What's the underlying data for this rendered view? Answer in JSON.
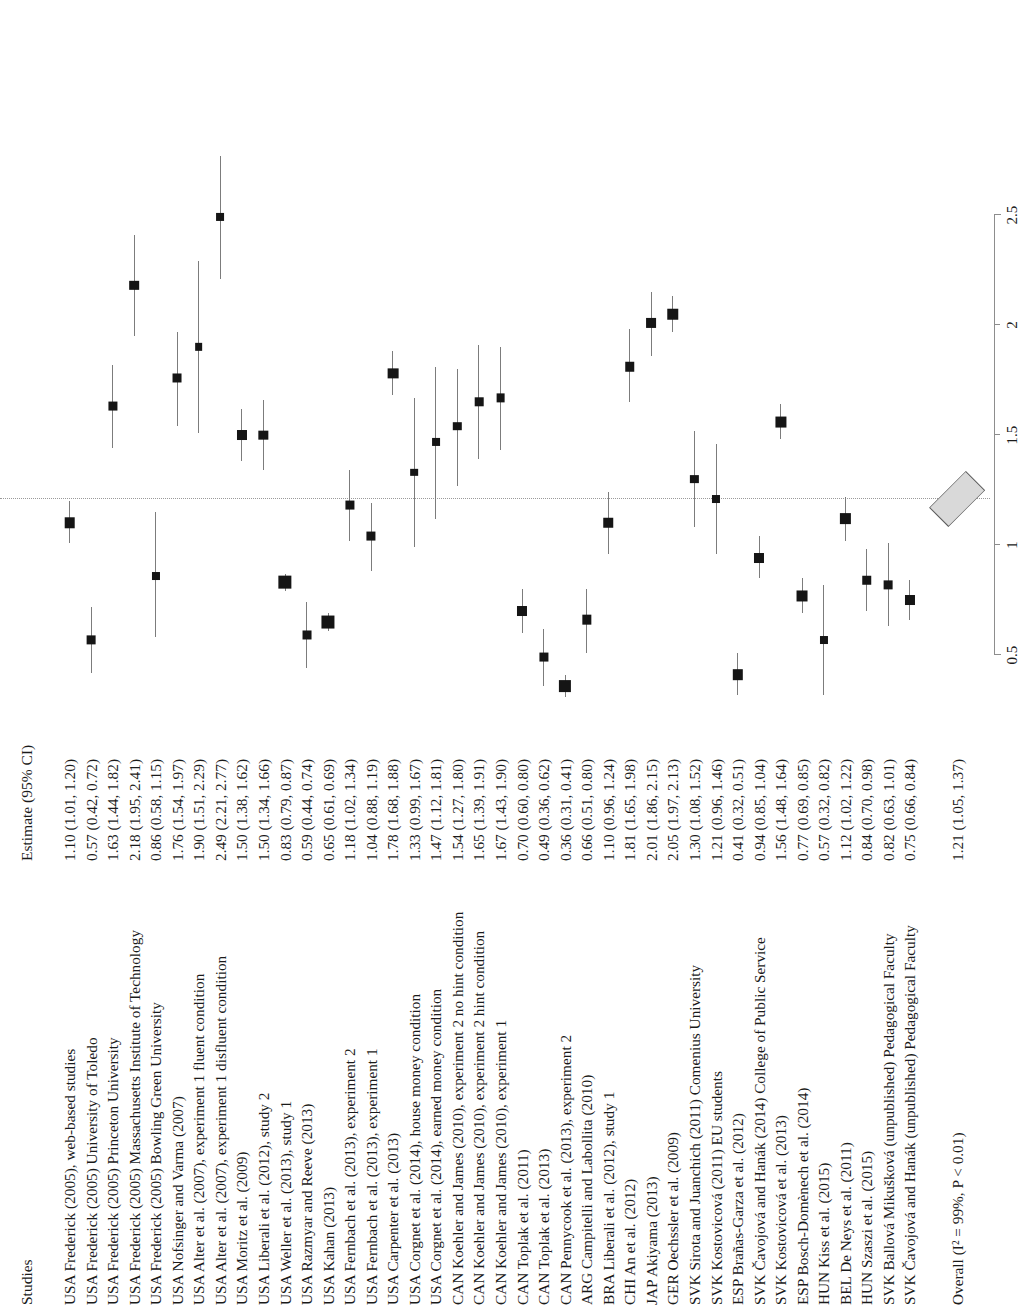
{
  "headers": {
    "studies": "Studies",
    "estimate": "Estimate (95% CI)"
  },
  "axis": {
    "ticks": [
      "0.5",
      "1",
      "1.5",
      "2",
      "2.5"
    ],
    "tick_values": [
      0.5,
      1,
      1.5,
      2,
      2.5
    ],
    "min": 0.5,
    "max": 2.5
  },
  "overall": {
    "label": "Overall (I² = 99%, P < 0.01)",
    "estimate_text": "1.21 (1.05, 1.37)",
    "estimate": 1.21,
    "ci_low": 1.05,
    "ci_high": 1.37
  },
  "chart_data": {
    "type": "forest",
    "title": "",
    "xlabel": "",
    "ylabel": "",
    "xlim": [
      0.5,
      2.5
    ],
    "grid": false,
    "reference_line": 1.21,
    "effect_measure": "Estimate (95% CI)",
    "columns": [
      "Studies",
      "Estimate (95% CI)"
    ],
    "rows": [
      {
        "label": "USA Frederick (2005), web-based studies",
        "estimate": 1.1,
        "ci_low": 1.01,
        "ci_high": 1.2,
        "text": "1.10 (1.01, 1.20)",
        "weight": 0.62
      },
      {
        "label": "USA Frederick (2005) University of Toledo",
        "estimate": 0.57,
        "ci_low": 0.42,
        "ci_high": 0.72,
        "text": "0.57 (0.42, 0.72)",
        "weight": 0.42
      },
      {
        "label": "USA Frederick (2005) Princeton University",
        "estimate": 1.63,
        "ci_low": 1.44,
        "ci_high": 1.82,
        "text": "1.63 (1.44, 1.82)",
        "weight": 0.46
      },
      {
        "label": "USA Frederick (2005) Massachusetts Institute of Technology",
        "estimate": 2.18,
        "ci_low": 1.95,
        "ci_high": 2.41,
        "text": "2.18 (1.95, 2.41)",
        "weight": 0.52
      },
      {
        "label": "USA Frederick (2005) Bowling Green University",
        "estimate": 0.86,
        "ci_low": 0.58,
        "ci_high": 1.15,
        "text": "0.86 (0.58, 1.15)",
        "weight": 0.34
      },
      {
        "label": "USA Nofsinger and Varma (2007)",
        "estimate": 1.76,
        "ci_low": 1.54,
        "ci_high": 1.97,
        "text": "1.76 (1.54, 1.97)",
        "weight": 0.44
      },
      {
        "label": "USA Alter et al. (2007), experiment 1 fluent condition",
        "estimate": 1.9,
        "ci_low": 1.51,
        "ci_high": 2.29,
        "text": "1.90 (1.51, 2.29)",
        "weight": 0.3
      },
      {
        "label": "USA Alter et al. (2007), experiment 1 disfluent condition",
        "estimate": 2.49,
        "ci_low": 2.21,
        "ci_high": 2.77,
        "text": "2.49 (2.21, 2.77)",
        "weight": 0.32
      },
      {
        "label": "USA Moritz et al. (2009)",
        "estimate": 1.5,
        "ci_low": 1.38,
        "ci_high": 1.62,
        "text": "1.50 (1.38, 1.62)",
        "weight": 0.56
      },
      {
        "label": "USA Liberali et al. (2012), study 2",
        "estimate": 1.5,
        "ci_low": 1.34,
        "ci_high": 1.66,
        "text": "1.50 (1.34, 1.66)",
        "weight": 0.48
      },
      {
        "label": "USA Weller et al. (2013), study 1",
        "estimate": 0.83,
        "ci_low": 0.79,
        "ci_high": 0.87,
        "text": "0.83 (0.79, 0.87)",
        "weight": 0.92
      },
      {
        "label": "USA Razmyar and Reeve (2013)",
        "estimate": 0.59,
        "ci_low": 0.44,
        "ci_high": 0.74,
        "text": "0.59 (0.44, 0.74)",
        "weight": 0.44
      },
      {
        "label": "USA Kahan (2013)",
        "estimate": 0.65,
        "ci_low": 0.61,
        "ci_high": 0.69,
        "text": "0.65 (0.61, 0.69)",
        "weight": 0.9
      },
      {
        "label": "USA Fernbach et al. (2013), experiment 2",
        "estimate": 1.18,
        "ci_low": 1.02,
        "ci_high": 1.34,
        "text": "1.18 (1.02, 1.34)",
        "weight": 0.46
      },
      {
        "label": "USA Fernbach et al. (2013), experiment 1",
        "estimate": 1.04,
        "ci_low": 0.88,
        "ci_high": 1.19,
        "text": "1.04 (0.88, 1.19)",
        "weight": 0.46
      },
      {
        "label": "USA Carpenter et al. (2013)",
        "estimate": 1.78,
        "ci_low": 1.68,
        "ci_high": 1.88,
        "text": "1.78 (1.68, 1.88)",
        "weight": 0.64
      },
      {
        "label": "USA Corgnet et al. (2014), house money condition",
        "estimate": 1.33,
        "ci_low": 0.99,
        "ci_high": 1.67,
        "text": "1.33 (0.99, 1.67)",
        "weight": 0.3
      },
      {
        "label": "USA Corgnet et al. (2014), earned money condition",
        "estimate": 1.47,
        "ci_low": 1.12,
        "ci_high": 1.81,
        "text": "1.47 (1.12, 1.81)",
        "weight": 0.32
      },
      {
        "label": "CAN Koehler and James (2010), experiment 2 no hint condition",
        "estimate": 1.54,
        "ci_low": 1.27,
        "ci_high": 1.8,
        "text": "1.54 (1.27, 1.80)",
        "weight": 0.38
      },
      {
        "label": "CAN Koehler and James (2010), experiment 2 hint condition",
        "estimate": 1.65,
        "ci_low": 1.39,
        "ci_high": 1.91,
        "text": "1.65 (1.39, 1.91)",
        "weight": 0.4
      },
      {
        "label": "CAN Koehler and James (2010), experiment 1",
        "estimate": 1.67,
        "ci_low": 1.43,
        "ci_high": 1.9,
        "text": "1.67 (1.43, 1.90)",
        "weight": 0.42
      },
      {
        "label": "CAN Toplak et al. (2011)",
        "estimate": 0.7,
        "ci_low": 0.6,
        "ci_high": 0.8,
        "text": "0.70 (0.60, 0.80)",
        "weight": 0.56
      },
      {
        "label": "CAN Toplak et al. (2013)",
        "estimate": 0.49,
        "ci_low": 0.36,
        "ci_high": 0.62,
        "text": "0.49 (0.36, 0.62)",
        "weight": 0.46
      },
      {
        "label": "CAN Pennycook et al. (2013), experiment 2",
        "estimate": 0.36,
        "ci_low": 0.31,
        "ci_high": 0.41,
        "text": "0.36 (0.31, 0.41)",
        "weight": 0.8
      },
      {
        "label": "ARG Campitelli and Labollita (2010)",
        "estimate": 0.66,
        "ci_low": 0.51,
        "ci_high": 0.8,
        "text": "0.66 (0.51, 0.80)",
        "weight": 0.48
      },
      {
        "label": "BRA Liberali et al. (2012), study 1",
        "estimate": 1.1,
        "ci_low": 0.96,
        "ci_high": 1.24,
        "text": "1.10 (0.96, 1.24)",
        "weight": 0.5
      },
      {
        "label": "CHI An et al. (2012)",
        "estimate": 1.81,
        "ci_low": 1.65,
        "ci_high": 1.98,
        "text": "1.81 (1.65, 1.98)",
        "weight": 0.5
      },
      {
        "label": "JAP Akiyama (2013)",
        "estimate": 2.01,
        "ci_low": 1.86,
        "ci_high": 2.15,
        "text": "2.01 (1.86, 2.15)",
        "weight": 0.54
      },
      {
        "label": "GER Oechssler et al. (2009)",
        "estimate": 2.05,
        "ci_low": 1.97,
        "ci_high": 2.13,
        "text": "2.05 (1.97, 2.13)",
        "weight": 0.72
      },
      {
        "label": "SVK Sirota and Juanchich (2011) Comenius University",
        "estimate": 1.3,
        "ci_low": 1.08,
        "ci_high": 1.52,
        "text": "1.30 (1.08, 1.52)",
        "weight": 0.36
      },
      {
        "label": "SVK Kostovicová (2011) EU students",
        "estimate": 1.21,
        "ci_low": 0.96,
        "ci_high": 1.46,
        "text": "1.21 (0.96, 1.46)",
        "weight": 0.34
      },
      {
        "label": "ESP Brañas-Garza et al. (2012)",
        "estimate": 0.41,
        "ci_low": 0.32,
        "ci_high": 0.51,
        "text": "0.41 (0.32, 0.51)",
        "weight": 0.6
      },
      {
        "label": "SVK Čavojová and Hanák (2014) College of Public Service",
        "estimate": 0.94,
        "ci_low": 0.85,
        "ci_high": 1.04,
        "text": "0.94 (0.85, 1.04)",
        "weight": 0.56
      },
      {
        "label": "SVK Kostovicová et al. (2013)",
        "estimate": 1.56,
        "ci_low": 1.48,
        "ci_high": 1.64,
        "text": "1.56 (1.48, 1.64)",
        "weight": 0.68
      },
      {
        "label": "ESP Bosch-Domènech et al. (2014)",
        "estimate": 0.77,
        "ci_low": 0.69,
        "ci_high": 0.85,
        "text": "0.77 (0.69, 0.85)",
        "weight": 0.66
      },
      {
        "label": "HUN Kiss et al. (2015)",
        "estimate": 0.57,
        "ci_low": 0.32,
        "ci_high": 0.82,
        "text": "0.57 (0.32, 0.82)",
        "weight": 0.34
      },
      {
        "label": "BEL De Neys et al. (2011)",
        "estimate": 1.12,
        "ci_low": 1.02,
        "ci_high": 1.22,
        "text": "1.12 (1.02, 1.22)",
        "weight": 0.58
      },
      {
        "label": "HUN Szaszi et al. (2015)",
        "estimate": 0.84,
        "ci_low": 0.7,
        "ci_high": 0.98,
        "text": "0.84 (0.70, 0.98)",
        "weight": 0.5
      },
      {
        "label": "SVK Ballová Mikušková (unpublished) Pedagogical Faculty",
        "estimate": 0.82,
        "ci_low": 0.63,
        "ci_high": 1.01,
        "text": "0.82 (0.63, 1.01)",
        "weight": 0.42
      },
      {
        "label": "SVK Čavojová and Hanák (unpublished) Pedagogical Faculty",
        "estimate": 0.75,
        "ci_low": 0.66,
        "ci_high": 0.84,
        "text": "0.75 (0.66, 0.84)",
        "weight": 0.56
      }
    ],
    "summary": {
      "label": "Overall (I² = 99%, P < 0.01)",
      "estimate": 1.21,
      "ci_low": 1.05,
      "ci_high": 1.37,
      "text": "1.21 (1.05, 1.37)"
    }
  }
}
